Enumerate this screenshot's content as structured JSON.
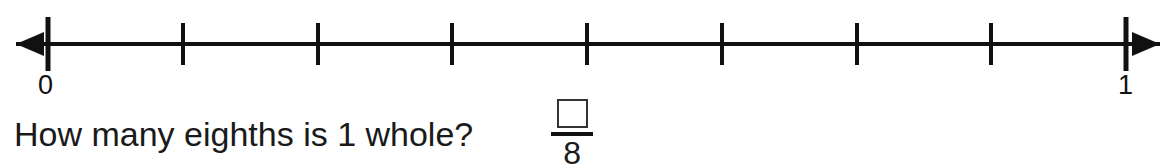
{
  "worksheet": {
    "question": "How many eighths is 1 whole?",
    "number_line": {
      "start_label": "0",
      "end_label": "1",
      "divisions": 8,
      "tick_count": 9,
      "left_arrow": "left-arrow",
      "right_arrow": "right-arrow",
      "line_color": "#111111",
      "start_x": 48,
      "end_x": 1126,
      "line_y": 44,
      "endpoint_tick_half": 27,
      "interior_tick_half": 21,
      "left_arrow_tip_x": 16,
      "right_arrow_tip_x": 1160,
      "ticks": [
        {
          "index": 0,
          "value": "0/8",
          "x": 48,
          "type": "endpoint"
        },
        {
          "index": 1,
          "value": "1/8",
          "x": 183,
          "type": "interior"
        },
        {
          "index": 2,
          "value": "2/8",
          "x": 318,
          "type": "interior"
        },
        {
          "index": 3,
          "value": "3/8",
          "x": 452,
          "type": "interior"
        },
        {
          "index": 4,
          "value": "4/8",
          "x": 587,
          "type": "interior"
        },
        {
          "index": 5,
          "value": "5/8",
          "x": 722,
          "type": "interior"
        },
        {
          "index": 6,
          "value": "6/8",
          "x": 857,
          "type": "interior"
        },
        {
          "index": 7,
          "value": "7/8",
          "x": 991,
          "type": "interior"
        },
        {
          "index": 8,
          "value": "8/8",
          "x": 1126,
          "type": "endpoint"
        }
      ]
    },
    "answer": {
      "numerator_value": "",
      "numerator_placeholder": "",
      "denominator": "8"
    }
  }
}
